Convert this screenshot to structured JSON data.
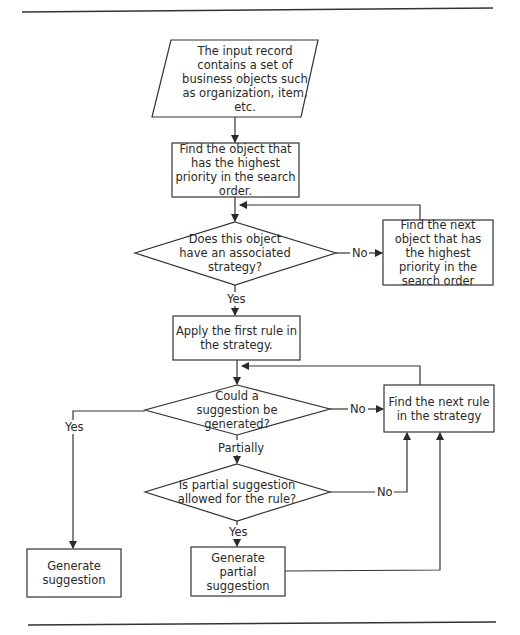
{
  "diagram": {
    "type": "flowchart",
    "nodes": {
      "input": "The input record contains a set of business objects such as organization, item, etc.",
      "find_highest": "Find the object that has the highest priority in the search order.",
      "has_strategy": "Does this object have an associated strategy?",
      "find_next_object": "Find the next object that has the highest priority in the search order",
      "apply_first_rule": "Apply the first rule in the strategy.",
      "could_generate": "Could a suggestion be generated?",
      "find_next_rule": "Find the next rule in the strategy",
      "partial_allowed": "Is partial suggestion allowed for the rule?",
      "generate_suggestion": "Generate suggestion",
      "generate_partial": "Generate partial suggestion"
    },
    "edge_labels": {
      "strategy_no": "No",
      "strategy_yes": "Yes",
      "generate_no": "No",
      "generate_yes": "Yes",
      "generate_partially": "Partially",
      "partial_no": "No",
      "partial_yes": "Yes"
    },
    "edges": [
      {
        "from": "input",
        "to": "find_highest"
      },
      {
        "from": "find_highest",
        "to": "has_strategy"
      },
      {
        "from": "has_strategy",
        "to": "find_next_object",
        "label": "No"
      },
      {
        "from": "find_next_object",
        "to": "has_strategy"
      },
      {
        "from": "has_strategy",
        "to": "apply_first_rule",
        "label": "Yes"
      },
      {
        "from": "apply_first_rule",
        "to": "could_generate"
      },
      {
        "from": "could_generate",
        "to": "find_next_rule",
        "label": "No"
      },
      {
        "from": "find_next_rule",
        "to": "could_generate"
      },
      {
        "from": "could_generate",
        "to": "generate_suggestion",
        "label": "Yes"
      },
      {
        "from": "could_generate",
        "to": "partial_allowed",
        "label": "Partially"
      },
      {
        "from": "partial_allowed",
        "to": "find_next_rule",
        "label": "No"
      },
      {
        "from": "partial_allowed",
        "to": "generate_partial",
        "label": "Yes"
      },
      {
        "from": "generate_partial",
        "to": "find_next_rule"
      }
    ]
  }
}
